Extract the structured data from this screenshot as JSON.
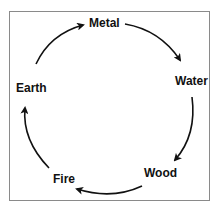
{
  "diagram": {
    "type": "cycle",
    "elements": [
      "Metal",
      "Water",
      "Wood",
      "Fire",
      "Earth"
    ],
    "labels": {
      "metal": "Metal",
      "water": "Water",
      "wood": "Wood",
      "fire": "Fire",
      "earth": "Earth"
    },
    "edges": [
      {
        "from": "Earth",
        "to": "Metal"
      },
      {
        "from": "Metal",
        "to": "Water"
      },
      {
        "from": "Water",
        "to": "Wood"
      },
      {
        "from": "Wood",
        "to": "Fire"
      },
      {
        "from": "Fire",
        "to": "Earth"
      }
    ],
    "direction": "clockwise"
  }
}
